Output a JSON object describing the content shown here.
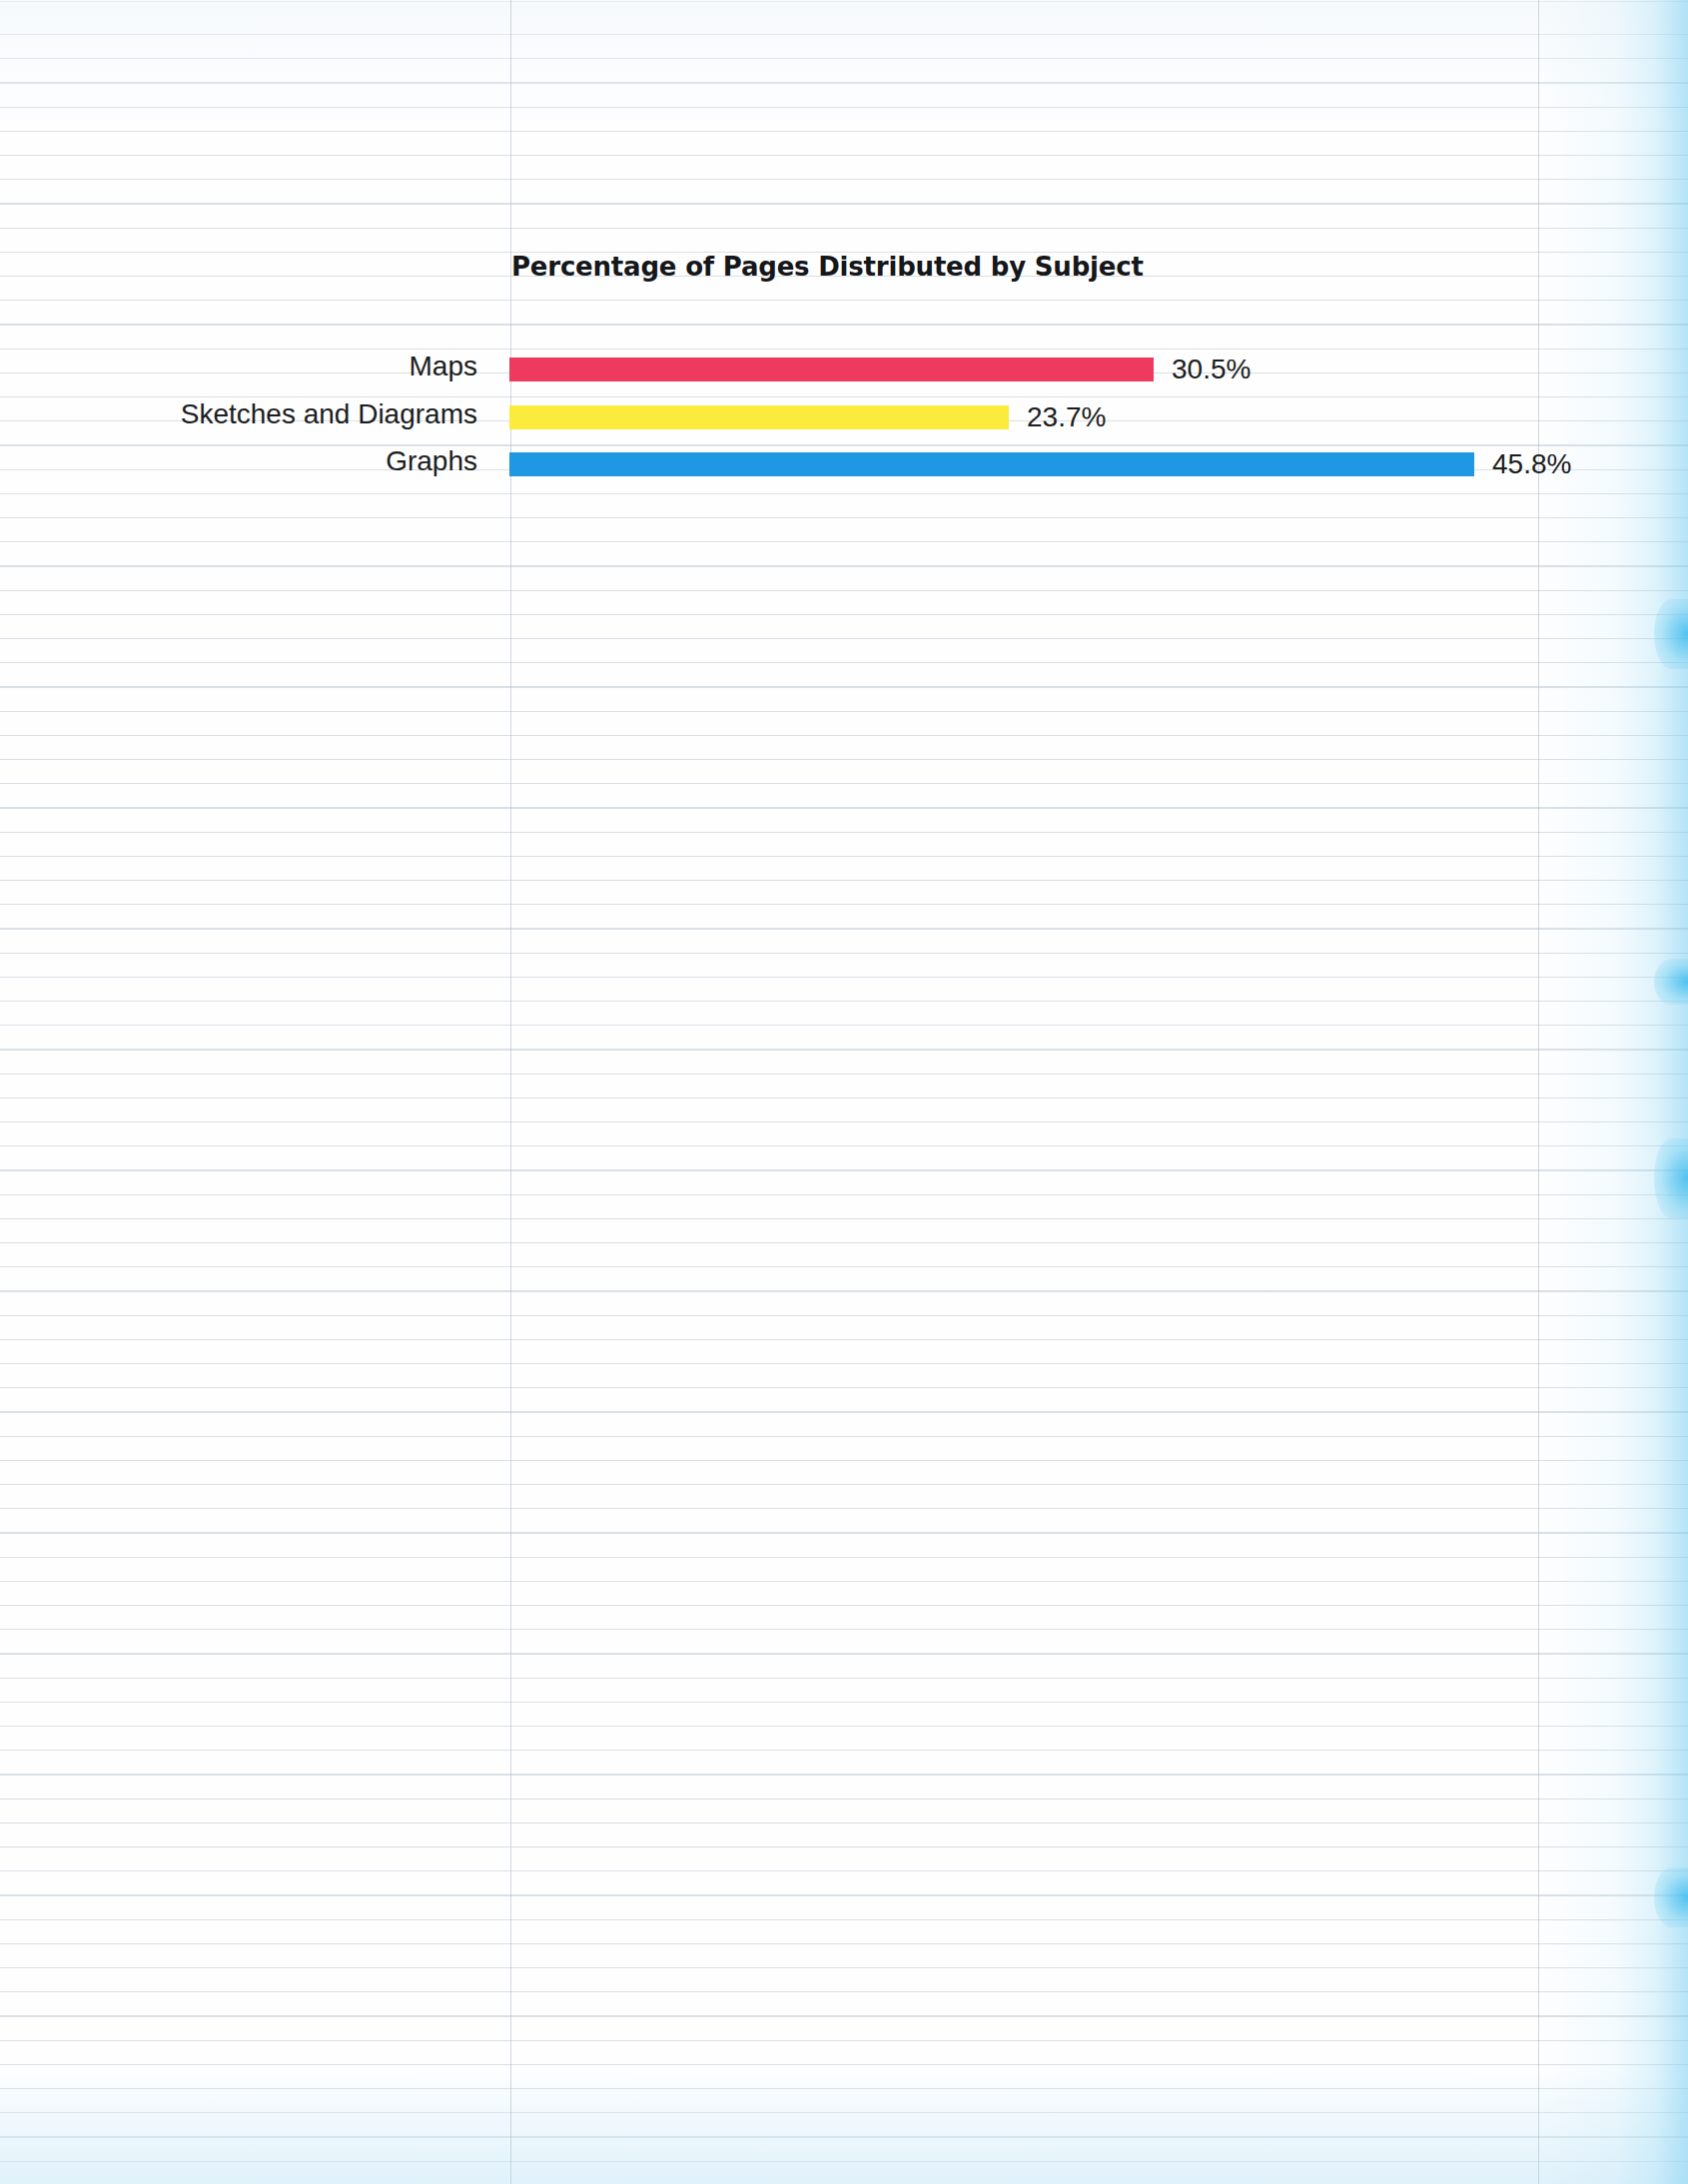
{
  "page": {
    "background": "#fefeff",
    "rule_color": "#a8b8c4",
    "edge_glow_color": "#78cdf0"
  },
  "chart": {
    "title": "Percentage of Pages Distributed by Subject",
    "bars": [
      {
        "label": "Maps",
        "value_text": "30.5%",
        "value": 30.5,
        "color": "#ef3a5f",
        "pixel_width": 645
      },
      {
        "label": "Sketches and Diagrams",
        "value_text": "23.7%",
        "value": 23.7,
        "color": "#faeb3d",
        "pixel_width": 500
      },
      {
        "label": "Graphs",
        "value_text": "45.8%",
        "value": 45.8,
        "color": "#1f97e2",
        "pixel_width": 966
      }
    ]
  },
  "chart_data": {
    "type": "bar",
    "orientation": "horizontal",
    "title": "Percentage of Pages Distributed by Subject",
    "categories": [
      "Maps",
      "Sketches and Diagrams",
      "Graphs"
    ],
    "values": [
      30.5,
      23.7,
      45.8
    ],
    "value_labels": [
      "30.5%",
      "23.7%",
      "45.8%"
    ],
    "colors": [
      "#ef3a5f",
      "#faeb3d",
      "#1f97e2"
    ],
    "xlabel": "",
    "ylabel": "",
    "xlim": [
      0,
      45.8
    ],
    "grid": false,
    "legend": "none",
    "axis_visible": false,
    "units": "percent"
  }
}
